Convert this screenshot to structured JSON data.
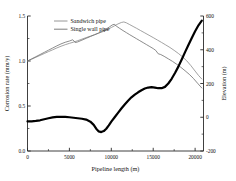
{
  "chart_data": {
    "type": "line",
    "title": "",
    "xlabel": "Pipeline length (m)",
    "ylabel": "Corrosion rate (mm/y)",
    "y2label": "Elevation (m)",
    "xlim": [
      0,
      21000
    ],
    "ylim": [
      0.0,
      1.5
    ],
    "y2lim": [
      -200,
      600
    ],
    "xticks": [
      0,
      5000,
      10000,
      15000,
      20000
    ],
    "xtick_labels": [
      "0",
      "5000",
      "10000",
      "15000",
      "20000"
    ],
    "yticks": [
      0.0,
      0.5,
      1.0,
      1.5
    ],
    "ytick_labels": [
      "0.0",
      "0.5",
      "1.0",
      "1.5"
    ],
    "y2ticks": [
      -200,
      0,
      200,
      400,
      600
    ],
    "y2tick_labels": [
      "-200",
      "0",
      "200",
      "400",
      "600"
    ],
    "grid": false,
    "legend_position": "top-left",
    "series": [
      {
        "name": "Sandwich pipe",
        "axis": "left",
        "color": "#8a8a8a",
        "width": 0.8,
        "points": [
          [
            0,
            1.0
          ],
          [
            500,
            1.02
          ],
          [
            1000,
            1.041
          ],
          [
            1500,
            1.062
          ],
          [
            2000,
            1.083
          ],
          [
            2500,
            1.104
          ],
          [
            3000,
            1.124
          ],
          [
            3500,
            1.145
          ],
          [
            4000,
            1.164
          ],
          [
            4500,
            1.181
          ],
          [
            5000,
            1.196
          ],
          [
            5500,
            1.21
          ],
          [
            6000,
            1.226
          ],
          [
            6500,
            1.243
          ],
          [
            7000,
            1.26
          ],
          [
            7500,
            1.276
          ],
          [
            8000,
            1.292
          ],
          [
            8500,
            1.309
          ],
          [
            9000,
            1.327
          ],
          [
            9500,
            1.348
          ],
          [
            10000,
            1.372
          ],
          [
            10400,
            1.392
          ],
          [
            10800,
            1.412
          ],
          [
            11200,
            1.428
          ],
          [
            11500,
            1.434
          ],
          [
            11800,
            1.424
          ],
          [
            12200,
            1.404
          ],
          [
            12600,
            1.384
          ],
          [
            13000,
            1.364
          ],
          [
            13500,
            1.338
          ],
          [
            14000,
            1.312
          ],
          [
            14500,
            1.286
          ],
          [
            15000,
            1.26
          ],
          [
            15500,
            1.233
          ],
          [
            16000,
            1.206
          ],
          [
            16500,
            1.178
          ],
          [
            17000,
            1.15
          ],
          [
            17500,
            1.118
          ],
          [
            18000,
            1.084
          ],
          [
            18500,
            1.046
          ],
          [
            19000,
            1.002
          ],
          [
            19500,
            0.948
          ],
          [
            20000,
            0.888
          ],
          [
            20400,
            0.84
          ],
          [
            20800,
            0.8
          ]
        ]
      },
      {
        "name": "Single wall pipe",
        "axis": "left",
        "color": "#6e6e6e",
        "width": 0.8,
        "points": [
          [
            0,
            1.0
          ],
          [
            500,
            1.024
          ],
          [
            1000,
            1.048
          ],
          [
            1500,
            1.072
          ],
          [
            2000,
            1.096
          ],
          [
            2500,
            1.12
          ],
          [
            3000,
            1.144
          ],
          [
            3500,
            1.168
          ],
          [
            4000,
            1.19
          ],
          [
            4500,
            1.208
          ],
          [
            5000,
            1.222
          ],
          [
            5400,
            1.236
          ],
          [
            5700,
            1.205
          ],
          [
            6000,
            1.212
          ],
          [
            6500,
            1.232
          ],
          [
            7000,
            1.252
          ],
          [
            7500,
            1.272
          ],
          [
            8000,
            1.292
          ],
          [
            8500,
            1.312
          ],
          [
            9000,
            1.334
          ],
          [
            9400,
            1.356
          ],
          [
            9800,
            1.38
          ],
          [
            10100,
            1.4
          ],
          [
            10350,
            1.408
          ],
          [
            10600,
            1.388
          ],
          [
            11000,
            1.362
          ],
          [
            11400,
            1.338
          ],
          [
            11800,
            1.315
          ],
          [
            12200,
            1.292
          ],
          [
            12600,
            1.27
          ],
          [
            13000,
            1.248
          ],
          [
            13400,
            1.226
          ],
          [
            13800,
            1.204
          ],
          [
            14200,
            1.182
          ],
          [
            14600,
            1.16
          ],
          [
            15000,
            1.138
          ],
          [
            15300,
            1.118
          ],
          [
            15600,
            1.08
          ],
          [
            15900,
            1.072
          ],
          [
            16300,
            1.052
          ],
          [
            16800,
            1.024
          ],
          [
            17300,
            0.996
          ],
          [
            17800,
            0.964
          ],
          [
            18300,
            0.93
          ],
          [
            18800,
            0.892
          ],
          [
            19300,
            0.852
          ],
          [
            19800,
            0.806
          ],
          [
            20300,
            0.752
          ],
          [
            20800,
            0.7
          ]
        ]
      },
      {
        "name": "Elevation profile",
        "axis": "right",
        "color": "#000000",
        "width": 2.2,
        "points": [
          [
            0,
            -25
          ],
          [
            500,
            -24
          ],
          [
            1000,
            -22
          ],
          [
            1500,
            -18
          ],
          [
            2000,
            -12
          ],
          [
            2500,
            -6
          ],
          [
            3000,
            -1
          ],
          [
            3500,
            2
          ],
          [
            4000,
            3
          ],
          [
            4500,
            2
          ],
          [
            5000,
            0
          ],
          [
            5500,
            -3
          ],
          [
            6000,
            -6
          ],
          [
            6500,
            -9
          ],
          [
            7000,
            -14
          ],
          [
            7500,
            -26
          ],
          [
            7900,
            -45
          ],
          [
            8200,
            -68
          ],
          [
            8500,
            -84
          ],
          [
            8800,
            -88
          ],
          [
            9100,
            -82
          ],
          [
            9400,
            -68
          ],
          [
            9700,
            -48
          ],
          [
            10000,
            -26
          ],
          [
            10400,
            0
          ],
          [
            10800,
            26
          ],
          [
            11200,
            52
          ],
          [
            11600,
            76
          ],
          [
            12000,
            98
          ],
          [
            12400,
            118
          ],
          [
            12800,
            134
          ],
          [
            13200,
            148
          ],
          [
            13600,
            160
          ],
          [
            14000,
            170
          ],
          [
            14400,
            176
          ],
          [
            14800,
            179
          ],
          [
            15200,
            176
          ],
          [
            15600,
            172
          ],
          [
            16000,
            172
          ],
          [
            16400,
            180
          ],
          [
            16800,
            200
          ],
          [
            17200,
            228
          ],
          [
            17600,
            262
          ],
          [
            18000,
            300
          ],
          [
            18400,
            342
          ],
          [
            18800,
            386
          ],
          [
            19200,
            428
          ],
          [
            19600,
            470
          ],
          [
            20000,
            510
          ],
          [
            20400,
            545
          ],
          [
            20800,
            572
          ]
        ]
      }
    ],
    "legend": [
      {
        "label": "Sandwich pipe",
        "color": "#8a8a8a"
      },
      {
        "label": "Single wall pipe",
        "color": "#6e6e6e"
      }
    ]
  }
}
